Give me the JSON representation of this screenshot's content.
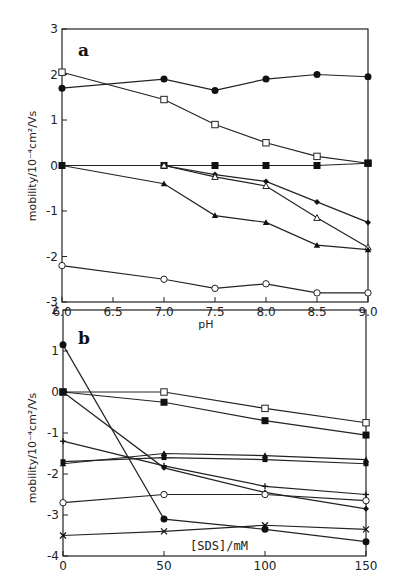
{
  "chart_data": [
    {
      "type": "line",
      "panel_label": "a",
      "title": "",
      "xlabel": "pH",
      "ylabel": "mobility/10^-4cm^2/Vs",
      "ylabel_display": "mobility/10⁻⁴cm²/Vs",
      "xlim": [
        6.0,
        9.0
      ],
      "ylim": [
        -3,
        3
      ],
      "xticks": [
        "6.0",
        "6.5",
        "7.0",
        "7.5",
        "8.0",
        "8.5",
        "9.0"
      ],
      "yticks": [
        "3",
        "2",
        "1",
        "0",
        "-1",
        "-2",
        "-3"
      ],
      "grid": false,
      "legend": null,
      "series": [
        {
          "name": "filled circle",
          "marker": "filled-circle",
          "x": [
            6.0,
            7.0,
            7.5,
            8.0,
            8.5,
            9.0
          ],
          "y": [
            1.7,
            1.9,
            1.65,
            1.9,
            2.0,
            1.95
          ]
        },
        {
          "name": "open square",
          "marker": "open-square",
          "x": [
            6.0,
            7.0,
            7.5,
            8.0,
            8.5,
            9.0
          ],
          "y": [
            2.05,
            1.45,
            0.9,
            0.5,
            0.2,
            0.05
          ]
        },
        {
          "name": "filled square",
          "marker": "filled-square",
          "x": [
            6.0,
            7.0,
            7.5,
            8.0,
            8.5,
            9.0
          ],
          "y": [
            0.0,
            0.0,
            0.0,
            0.0,
            0.0,
            0.05
          ]
        },
        {
          "name": "small filled diamond",
          "marker": "filled-diamond",
          "x": [
            6.0,
            7.0,
            7.5,
            8.0,
            8.5,
            9.0
          ],
          "y": [
            0.0,
            0.0,
            -0.2,
            -0.35,
            -0.8,
            -1.25
          ]
        },
        {
          "name": "open triangle",
          "marker": "open-triangle",
          "x": [
            7.0,
            7.5,
            8.0,
            8.5,
            9.0
          ],
          "y": [
            0.0,
            -0.25,
            -0.45,
            -1.15,
            -1.8
          ]
        },
        {
          "name": "filled triangle",
          "marker": "filled-triangle",
          "x": [
            6.0,
            7.0,
            7.5,
            8.0,
            8.5,
            9.0
          ],
          "y": [
            0.0,
            -0.4,
            -1.1,
            -1.25,
            -1.75,
            -1.85
          ]
        },
        {
          "name": "open circle",
          "marker": "open-circle",
          "x": [
            6.0,
            7.0,
            7.5,
            8.0,
            8.5,
            9.0
          ],
          "y": [
            -2.2,
            -2.5,
            -2.7,
            -2.6,
            -2.8,
            -2.8
          ]
        }
      ]
    },
    {
      "type": "line",
      "panel_label": "b",
      "title": "",
      "xlabel": "[SDS]/mM",
      "ylabel": "mobility/10^-4cm^2/Vs",
      "ylabel_display": "mobility/10⁻⁴cm²/Vs",
      "xlim": [
        0,
        150
      ],
      "ylim": [
        -4,
        2
      ],
      "xticks": [
        "0",
        "50",
        "100",
        "150"
      ],
      "yticks": [
        "2",
        "1",
        "0",
        "-1",
        "-2",
        "-3",
        "-4"
      ],
      "grid": false,
      "legend": null,
      "series": [
        {
          "name": "filled circle",
          "marker": "filled-circle",
          "x": [
            0,
            50,
            100,
            150
          ],
          "y": [
            1.15,
            -3.1,
            -3.35,
            -3.65
          ]
        },
        {
          "name": "open square",
          "marker": "open-square",
          "x": [
            0,
            50,
            100,
            150
          ],
          "y": [
            0.0,
            0.0,
            -0.4,
            -0.75
          ]
        },
        {
          "name": "filled square",
          "marker": "filled-square",
          "x": [
            0,
            50,
            100,
            150
          ],
          "y": [
            0.0,
            -0.25,
            -0.7,
            -1.05
          ]
        },
        {
          "name": "small filled diamond",
          "marker": "filled-diamond",
          "x": [
            0,
            50,
            100,
            150
          ],
          "y": [
            0.0,
            -1.85,
            -2.45,
            -2.85
          ]
        },
        {
          "name": "filled triangle",
          "marker": "filled-triangle",
          "x": [
            0,
            50,
            100,
            150
          ],
          "y": [
            -1.75,
            -1.5,
            -1.55,
            -1.65
          ]
        },
        {
          "name": "filled square 2",
          "marker": "filled-small",
          "x": [
            0,
            50,
            100,
            150
          ],
          "y": [
            -1.7,
            -1.6,
            -1.65,
            -1.75
          ]
        },
        {
          "name": "plus",
          "marker": "plus",
          "x": [
            0,
            50,
            100,
            150
          ],
          "y": [
            -1.2,
            -1.8,
            -2.3,
            -2.5
          ]
        },
        {
          "name": "open circle",
          "marker": "open-circle",
          "x": [
            0,
            50,
            100,
            150
          ],
          "y": [
            -2.7,
            -2.5,
            -2.5,
            -2.65
          ]
        },
        {
          "name": "cross",
          "marker": "cross",
          "x": [
            0,
            50,
            100,
            150
          ],
          "y": [
            -3.5,
            -3.4,
            -3.25,
            -3.35
          ]
        }
      ]
    }
  ],
  "panels": {
    "a": {
      "letter": "a",
      "xlabel": "pH",
      "ylabel": "mobility/10⁻⁴cm²/Vs"
    },
    "b": {
      "letter": "b",
      "xlabel": "[SDS]/mM",
      "ylabel": "mobility/10⁻⁴cm²/Vs"
    }
  }
}
